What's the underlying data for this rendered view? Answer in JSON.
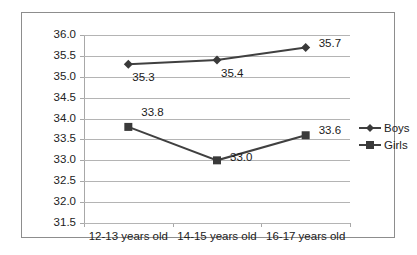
{
  "chart_data": {
    "type": "line",
    "title": "",
    "xlabel": "",
    "ylabel": "",
    "categories": [
      "12-13 years old",
      "14-15 years old",
      "16-17 years old"
    ],
    "series": [
      {
        "name": "Boys",
        "marker": "diamond",
        "values": [
          35.3,
          35.4,
          35.7
        ]
      },
      {
        "name": "Girls",
        "marker": "square",
        "values": [
          33.8,
          33.0,
          33.6
        ]
      }
    ],
    "ylim": [
      31.5,
      36.0
    ],
    "ytick_labels": [
      "36.0",
      "35.5",
      "35.0",
      "34.5",
      "34.0",
      "33.5",
      "33.0",
      "32.5",
      "32.0",
      "31.5"
    ],
    "ytick_values": [
      36.0,
      35.5,
      35.0,
      34.5,
      34.0,
      33.5,
      33.0,
      32.5,
      32.0,
      31.5
    ],
    "data_labels": {
      "boys": [
        "35.3",
        "35.4",
        "35.7"
      ],
      "girls": [
        "33.8",
        "33.0",
        "33.6"
      ]
    },
    "grid": true,
    "legend_position": "right",
    "colors": {
      "series_line": "#404040",
      "marker": "#3a3a3a",
      "gridline": "#b4b4b4",
      "axis": "#a8a8a8",
      "border": "#8d8d8d",
      "text": "#222222",
      "background": "#ffffff"
    }
  },
  "legend": {
    "items": [
      {
        "label": "Boys"
      },
      {
        "label": "Girls"
      }
    ]
  }
}
